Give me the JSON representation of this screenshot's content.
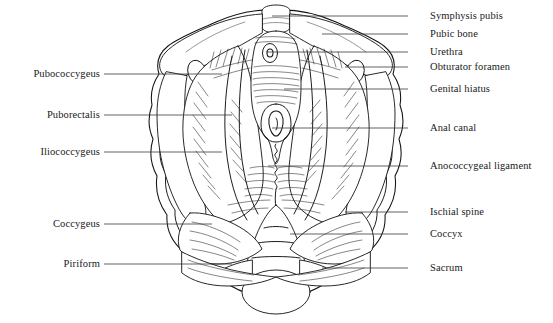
{
  "figure": {
    "background_color": "#ffffff",
    "line_color": "#111111",
    "leader_color": "#3a3a3a",
    "text_color": "#1a1a1a"
  },
  "labels_left": [
    {
      "id": "pubococcygeus",
      "text": "Pubococcygeus",
      "text_x": 100,
      "y": 74,
      "leader_x1": 104,
      "leader_x2": 222
    },
    {
      "id": "puborectalis",
      "text": "Puborectalis",
      "text_x": 100,
      "y": 115,
      "leader_x1": 104,
      "leader_x2": 232
    },
    {
      "id": "iliococcygeus",
      "text": "Iliococcygeus",
      "text_x": 100,
      "y": 152,
      "leader_x1": 104,
      "leader_x2": 222
    },
    {
      "id": "coccygeus",
      "text": "Coccygeus",
      "text_x": 100,
      "y": 224,
      "leader_x1": 104,
      "leader_x2": 212
    },
    {
      "id": "piriform",
      "text": "Piriform",
      "text_x": 100,
      "y": 264,
      "leader_x1": 104,
      "leader_x2": 232
    }
  ],
  "labels_right": [
    {
      "id": "symphysis-pubis",
      "text": "Symphysis pubis",
      "text_x": 430,
      "y": 16,
      "leader_x1": 408,
      "leader_x2": 272
    },
    {
      "id": "pubic-bone",
      "text": "Pubic bone",
      "text_x": 430,
      "y": 34,
      "leader_x1": 408,
      "leader_x2": 322
    },
    {
      "id": "urethra",
      "text": "Urethra",
      "text_x": 430,
      "y": 52,
      "leader_x1": 408,
      "leader_x2": 266
    },
    {
      "id": "obturator-foramen",
      "text": "Obturator foramen",
      "text_x": 430,
      "y": 67,
      "leader_x1": 408,
      "leader_x2": 345
    },
    {
      "id": "genital-hiatus",
      "text": "Genital hiatus",
      "text_x": 430,
      "y": 89,
      "leader_x1": 408,
      "leader_x2": 284
    },
    {
      "id": "anal-canal",
      "text": "Anal canal",
      "text_x": 430,
      "y": 128,
      "leader_x1": 408,
      "leader_x2": 272
    },
    {
      "id": "anococcygeal-ligament",
      "text": "Anococcygeal ligament",
      "text_x": 430,
      "y": 166,
      "leader_x1": 408,
      "leader_x2": 268
    },
    {
      "id": "ischial-spine",
      "text": "Ischial spine",
      "text_x": 430,
      "y": 212,
      "leader_x1": 408,
      "leader_x2": 345
    },
    {
      "id": "coccyx",
      "text": "Coccyx",
      "text_x": 430,
      "y": 234,
      "leader_x1": 408,
      "leader_x2": 290
    },
    {
      "id": "sacrum",
      "text": "Sacrum",
      "text_x": 430,
      "y": 268,
      "leader_x1": 408,
      "leader_x2": 322
    }
  ]
}
